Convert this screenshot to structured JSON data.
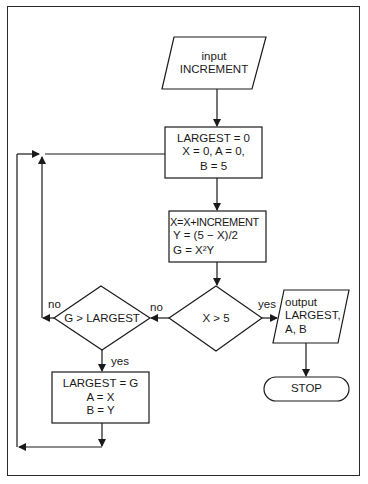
{
  "diagram": {
    "type": "flowchart",
    "nodes": {
      "input": {
        "shape": "parallelogram",
        "lines": [
          "input",
          "INCREMENT"
        ]
      },
      "init": {
        "shape": "process",
        "lines": [
          "LARGEST = 0",
          "X = 0, A = 0,",
          "B = 5"
        ]
      },
      "compute": {
        "shape": "process",
        "lines": [
          "X=X+INCREMENT",
          "Y = (5 − X)/2",
          "G = X²Y"
        ]
      },
      "decision_x": {
        "shape": "decision",
        "text": "X > 5"
      },
      "decision_g": {
        "shape": "decision",
        "text": "G > LARGEST"
      },
      "update": {
        "shape": "process",
        "lines": [
          "LARGEST = G",
          "A = X",
          "B = Y"
        ]
      },
      "output": {
        "shape": "parallelogram",
        "lines": [
          "output",
          "LARGEST,",
          "A, B"
        ]
      },
      "stop": {
        "shape": "terminator",
        "text": "STOP"
      }
    },
    "edge_labels": {
      "x_yes": "yes",
      "x_no": "no",
      "g_no": "no",
      "g_yes": "yes"
    }
  }
}
